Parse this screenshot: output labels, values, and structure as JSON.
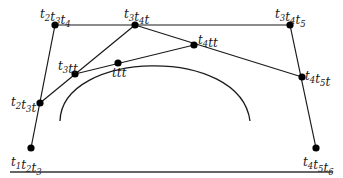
{
  "diagram": {
    "type": "blossoming de Boor construction",
    "colors": {
      "ink": "#1a1a1a",
      "point": "#000000",
      "rule": "#333333"
    },
    "points": [
      {
        "id": "t1t2t3",
        "x": 31,
        "y": 148,
        "label": [
          [
            "t",
            "1"
          ],
          [
            "t",
            "2"
          ],
          [
            "t",
            "3"
          ]
        ],
        "lx": 11,
        "ly": 166
      },
      {
        "id": "t2t3t",
        "x": 40,
        "y": 103,
        "label": [
          [
            "t",
            "2"
          ],
          [
            "t",
            "3"
          ],
          [
            "t",
            ""
          ]
        ],
        "lx": 11,
        "ly": 106
      },
      {
        "id": "t2t3t4",
        "x": 55,
        "y": 25,
        "label": [
          [
            "t",
            "2"
          ],
          [
            "t",
            "3"
          ],
          [
            "t",
            "4"
          ]
        ],
        "lx": 40,
        "ly": 18
      },
      {
        "id": "t3t4t",
        "x": 135,
        "y": 25,
        "label": [
          [
            "t",
            "3"
          ],
          [
            "t",
            "4"
          ],
          [
            "t",
            ""
          ]
        ],
        "lx": 124,
        "ly": 18
      },
      {
        "id": "t3t4t5",
        "x": 290,
        "y": 25,
        "label": [
          [
            "t",
            "3"
          ],
          [
            "t",
            "4"
          ],
          [
            "t",
            "5"
          ]
        ],
        "lx": 275,
        "ly": 18
      },
      {
        "id": "t3tt",
        "x": 75,
        "y": 74,
        "label": [
          [
            "t",
            "3"
          ],
          [
            "t",
            ""
          ],
          [
            "t",
            ""
          ]
        ],
        "lx": 58,
        "ly": 70
      },
      {
        "id": "ttt",
        "x": 118,
        "y": 63,
        "label": [
          [
            "t",
            ""
          ],
          [
            "t",
            ""
          ],
          [
            "t",
            ""
          ]
        ],
        "lx": 112,
        "ly": 77
      },
      {
        "id": "t4tt",
        "x": 194,
        "y": 45,
        "label": [
          [
            "t",
            "4"
          ],
          [
            "t",
            ""
          ],
          [
            "t",
            ""
          ]
        ],
        "lx": 198,
        "ly": 44
      },
      {
        "id": "t4t5t",
        "x": 302,
        "y": 77,
        "label": [
          [
            "t",
            "4"
          ],
          [
            "t",
            "5"
          ],
          [
            "t",
            ""
          ]
        ],
        "lx": 305,
        "ly": 80
      },
      {
        "id": "t4t5t6",
        "x": 316,
        "y": 148,
        "label": [
          [
            "t",
            "4"
          ],
          [
            "t",
            "5"
          ],
          [
            "t",
            "6"
          ]
        ],
        "lx": 303,
        "ly": 166
      }
    ],
    "edges": [
      [
        "t1t2t3",
        "t2t3t4"
      ],
      [
        "t2t3t4",
        "t3t4t5"
      ],
      [
        "t3t4t5",
        "t4t5t6"
      ],
      [
        "t2t3t",
        "t3t4t"
      ],
      [
        "t3t4t",
        "t4t5t"
      ],
      [
        "t3tt",
        "t4tt"
      ]
    ],
    "curve": {
      "path": "M 60 121 C 62 50, 240 45, 250 121"
    },
    "rule": {
      "x1": 10,
      "y1": 172,
      "x2": 333,
      "y2": 172
    }
  }
}
